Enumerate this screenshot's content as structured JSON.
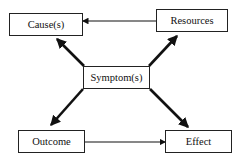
{
  "diagram": {
    "nodes": [
      {
        "id": "causes",
        "label": "Cause(s)"
      },
      {
        "id": "resources",
        "label": "Resources"
      },
      {
        "id": "symptoms",
        "label": "Symptom(s)"
      },
      {
        "id": "outcome",
        "label": "Outcome"
      },
      {
        "id": "effect",
        "label": "Effect"
      }
    ],
    "edges": [
      {
        "from": "resources",
        "to": "causes",
        "style": "thin"
      },
      {
        "from": "symptoms",
        "to": "causes",
        "style": "thick"
      },
      {
        "from": "symptoms",
        "to": "resources",
        "style": "thick"
      },
      {
        "from": "symptoms",
        "to": "outcome",
        "style": "thick"
      },
      {
        "from": "symptoms",
        "to": "effect",
        "style": "thick"
      },
      {
        "from": "outcome",
        "to": "effect",
        "style": "thin"
      }
    ]
  }
}
